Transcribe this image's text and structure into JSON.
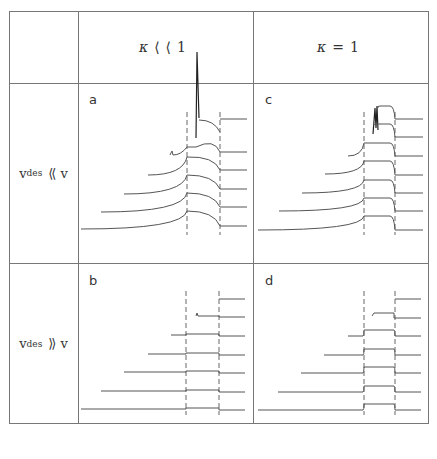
{
  "columns": [
    {
      "symbol": "κ",
      "relation": "⟨⟨",
      "value": "1"
    },
    {
      "symbol": "κ",
      "relation": "=",
      "value": "1"
    }
  ],
  "rows": [
    {
      "var": "v",
      "sub": "des",
      "relation": "⟨⟨",
      "rhs": "v"
    },
    {
      "var": "v",
      "sub": "des",
      "relation": "⟩⟩",
      "rhs": "v"
    }
  ],
  "panels": {
    "a": {
      "label": "a",
      "column": "κ ⟨⟨ 1",
      "row": "v_des ⟨⟨ v",
      "curves": 7,
      "shape": "smooth rise and decay, spike on top curve"
    },
    "b": {
      "label": "b",
      "column": "κ ⟨⟨ 1",
      "row": "v_des ⟩⟩ v",
      "curves": 7,
      "shape": "flat step profiles"
    },
    "c": {
      "label": "c",
      "column": "κ = 1",
      "row": "v_des ⟨⟨ v",
      "curves": 7,
      "shape": "sharp rectangular pulses, spike on top"
    },
    "d": {
      "label": "d",
      "column": "κ = 1",
      "row": "v_des ⟩⟩ v",
      "curves": 7,
      "shape": "small rectangular steps"
    }
  },
  "colors": {
    "grid": "#777777",
    "curve": "#555555",
    "text": "#333333"
  }
}
